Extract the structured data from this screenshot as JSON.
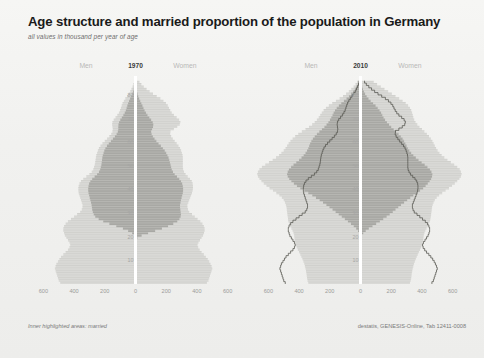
{
  "header": {
    "title": "Age structure and married proportion of the population in Germany",
    "subtitle": "all values in thousand per year of age"
  },
  "footer": {
    "note": "Inner highlighted areas: married",
    "source": "destatis, GENESIS-Online, Tab 12411-0008"
  },
  "colors": {
    "background": "#f2f2f0",
    "total_fill": "#d9d9d6",
    "married_fill": "#a8a8a4",
    "stripe": "#c6c6c2",
    "outline": "#55554f",
    "axis_text": "#9c9c9a",
    "title_text": "#1a1a1a"
  },
  "panels": [
    {
      "id": "1970",
      "year": "1970",
      "men_label": "Men",
      "women_label": "Women",
      "has_reference_outline": false
    },
    {
      "id": "2010",
      "year": "2010",
      "men_label": "Men",
      "women_label": "Women",
      "has_reference_outline": true
    }
  ],
  "chart_data": {
    "type": "bar",
    "title": "Age structure and married proportion of the population in Germany",
    "subtitle": "all values in thousand per year of age",
    "xlabel": "",
    "ylabel": "Age",
    "xlim": [
      -700,
      700
    ],
    "ylim": [
      0,
      88
    ],
    "xticks": [
      600,
      400,
      200,
      0,
      200,
      400,
      600
    ],
    "xtick_labels": [
      "600",
      "400",
      "200",
      "0",
      "200",
      "400",
      "600"
    ],
    "yticks": [
      10,
      20,
      30,
      40,
      50,
      60,
      70,
      80
    ],
    "ytick_labels": [
      "10",
      "20",
      "30",
      "40",
      "50",
      "60",
      "70",
      "80"
    ],
    "grid": false,
    "legend": "Inner highlighted areas: married",
    "source": "destatis, GENESIS-Online, Tab 12411-0008",
    "ages": [
      0,
      1,
      2,
      3,
      4,
      5,
      6,
      7,
      8,
      9,
      10,
      11,
      12,
      13,
      14,
      15,
      16,
      17,
      18,
      19,
      20,
      21,
      22,
      23,
      24,
      25,
      26,
      27,
      28,
      29,
      30,
      31,
      32,
      33,
      34,
      35,
      36,
      37,
      38,
      39,
      40,
      41,
      42,
      43,
      44,
      45,
      46,
      47,
      48,
      49,
      50,
      51,
      52,
      53,
      54,
      55,
      56,
      57,
      58,
      59,
      60,
      61,
      62,
      63,
      64,
      65,
      66,
      67,
      68,
      69,
      70,
      71,
      72,
      73,
      74,
      75,
      76,
      77,
      78,
      79,
      80,
      81,
      82,
      83,
      84,
      85
    ],
    "series": [
      {
        "name": "1970 Men total",
        "panel": "1970",
        "side": "men",
        "kind": "total",
        "values": [
          490,
          500,
          505,
          510,
          515,
          520,
          525,
          520,
          515,
          505,
          495,
          485,
          470,
          455,
          440,
          430,
          425,
          430,
          440,
          450,
          460,
          465,
          470,
          470,
          465,
          455,
          440,
          420,
          400,
          380,
          360,
          350,
          345,
          345,
          350,
          355,
          360,
          365,
          370,
          372,
          372,
          370,
          365,
          355,
          340,
          320,
          300,
          285,
          275,
          270,
          265,
          262,
          260,
          258,
          255,
          250,
          245,
          238,
          228,
          215,
          200,
          185,
          170,
          158,
          150,
          148,
          150,
          152,
          150,
          142,
          130,
          118,
          108,
          100,
          95,
          90,
          84,
          76,
          66,
          55,
          44,
          34,
          26,
          19,
          13,
          9
        ]
      },
      {
        "name": "1970 Men married",
        "panel": "1970",
        "side": "men",
        "kind": "married",
        "values": [
          0,
          0,
          0,
          0,
          0,
          0,
          0,
          0,
          0,
          0,
          0,
          0,
          0,
          0,
          0,
          0,
          0,
          0,
          0,
          2,
          8,
          22,
          48,
          82,
          125,
          170,
          210,
          240,
          262,
          272,
          278,
          282,
          284,
          286,
          290,
          294,
          298,
          302,
          306,
          308,
          308,
          306,
          302,
          294,
          282,
          266,
          250,
          238,
          230,
          226,
          222,
          220,
          218,
          216,
          213,
          208,
          203,
          196,
          186,
          174,
          160,
          147,
          134,
          123,
          115,
          112,
          112,
          111,
          107,
          99,
          89,
          79,
          70,
          63,
          58,
          53,
          48,
          42,
          35,
          28,
          21,
          15,
          11,
          7,
          5,
          3
        ]
      },
      {
        "name": "1970 Women total",
        "panel": "1970",
        "side": "women",
        "kind": "total",
        "values": [
          465,
          475,
          480,
          485,
          490,
          495,
          500,
          495,
          488,
          480,
          470,
          458,
          445,
          430,
          418,
          408,
          404,
          410,
          420,
          430,
          440,
          446,
          450,
          450,
          445,
          436,
          422,
          404,
          386,
          368,
          350,
          342,
          338,
          338,
          344,
          350,
          356,
          362,
          368,
          372,
          374,
          374,
          372,
          366,
          355,
          340,
          326,
          316,
          310,
          308,
          308,
          308,
          308,
          308,
          306,
          302,
          297,
          290,
          280,
          268,
          255,
          243,
          232,
          226,
          228,
          250,
          272,
          288,
          292,
          284,
          268,
          250,
          236,
          226,
          218,
          210,
          198,
          182,
          162,
          138,
          114,
          92,
          72,
          54,
          38,
          26
        ]
      },
      {
        "name": "1970 Women married",
        "panel": "1970",
        "side": "women",
        "kind": "married",
        "values": [
          0,
          0,
          0,
          0,
          0,
          0,
          0,
          0,
          0,
          0,
          0,
          0,
          0,
          0,
          0,
          0,
          0,
          0,
          2,
          12,
          40,
          82,
          128,
          172,
          212,
          246,
          272,
          286,
          294,
          296,
          294,
          292,
          290,
          290,
          293,
          296,
          300,
          304,
          308,
          310,
          310,
          308,
          304,
          296,
          285,
          270,
          255,
          244,
          236,
          232,
          228,
          224,
          220,
          215,
          208,
          200,
          190,
          178,
          165,
          150,
          136,
          124,
          113,
          105,
          102,
          108,
          114,
          116,
          112,
          102,
          90,
          78,
          68,
          59,
          52,
          45,
          38,
          31,
          24,
          18,
          13,
          9,
          6,
          4,
          2,
          1
        ]
      },
      {
        "name": "2010 Men total",
        "panel": "2010",
        "side": "men",
        "kind": "total",
        "values": [
          340,
          345,
          348,
          350,
          352,
          355,
          358,
          362,
          366,
          372,
          378,
          385,
          392,
          400,
          408,
          415,
          420,
          425,
          428,
          430,
          432,
          436,
          442,
          450,
          458,
          465,
          470,
          472,
          474,
          476,
          478,
          480,
          482,
          486,
          492,
          500,
          512,
          528,
          548,
          570,
          592,
          612,
          630,
          645,
          658,
          668,
          672,
          668,
          658,
          642,
          620,
          596,
          572,
          550,
          530,
          515,
          500,
          488,
          478,
          468,
          456,
          442,
          425,
          405,
          382,
          358,
          335,
          315,
          298,
          284,
          272,
          262,
          252,
          240,
          225,
          206,
          184,
          160,
          136,
          114,
          94,
          76,
          60,
          45,
          32,
          22
        ]
      },
      {
        "name": "2010 Men married",
        "panel": "2010",
        "side": "men",
        "kind": "married",
        "values": [
          0,
          0,
          0,
          0,
          0,
          0,
          0,
          0,
          0,
          0,
          0,
          0,
          0,
          0,
          0,
          0,
          0,
          0,
          0,
          1,
          3,
          8,
          16,
          28,
          44,
          62,
          82,
          102,
          122,
          142,
          162,
          182,
          202,
          222,
          244,
          266,
          290,
          314,
          340,
          366,
          392,
          414,
          434,
          450,
          464,
          474,
          478,
          474,
          466,
          452,
          436,
          418,
          400,
          384,
          370,
          358,
          348,
          340,
          334,
          328,
          320,
          310,
          298,
          284,
          268,
          251,
          235,
          221,
          209,
          199,
          190,
          182,
          175,
          166,
          155,
          141,
          125,
          108,
          91,
          75,
          61,
          48,
          37,
          27,
          18,
          12
        ]
      },
      {
        "name": "2010 Women total",
        "panel": "2010",
        "side": "women",
        "kind": "total",
        "values": [
          322,
          327,
          330,
          332,
          334,
          337,
          340,
          344,
          348,
          354,
          360,
          366,
          373,
          380,
          388,
          395,
          400,
          404,
          408,
          410,
          412,
          416,
          422,
          430,
          438,
          446,
          452,
          455,
          458,
          460,
          462,
          464,
          466,
          470,
          476,
          484,
          496,
          512,
          532,
          554,
          576,
          596,
          614,
          630,
          644,
          654,
          658,
          654,
          646,
          630,
          610,
          588,
          566,
          546,
          528,
          514,
          502,
          492,
          484,
          476,
          468,
          458,
          446,
          432,
          416,
          400,
          384,
          370,
          358,
          350,
          344,
          340,
          336,
          330,
          322,
          310,
          294,
          274,
          252,
          228,
          204,
          180,
          156,
          132,
          108,
          86
        ]
      },
      {
        "name": "2010 Women married",
        "panel": "2010",
        "side": "women",
        "kind": "married",
        "values": [
          0,
          0,
          0,
          0,
          0,
          0,
          0,
          0,
          0,
          0,
          0,
          0,
          0,
          0,
          0,
          0,
          0,
          0,
          1,
          3,
          8,
          18,
          34,
          54,
          78,
          102,
          126,
          148,
          170,
          190,
          210,
          228,
          246,
          264,
          284,
          304,
          324,
          344,
          366,
          388,
          408,
          424,
          438,
          450,
          460,
          466,
          468,
          462,
          452,
          436,
          418,
          398,
          378,
          360,
          344,
          330,
          318,
          308,
          300,
          292,
          284,
          274,
          262,
          248,
          232,
          216,
          200,
          186,
          172,
          160,
          150,
          142,
          134,
          124,
          112,
          98,
          82,
          66,
          52,
          40,
          30,
          22,
          16,
          11,
          7,
          5
        ]
      }
    ],
    "reference_outline": {
      "description": "1970 total population profile overlaid as a line on the 2010 panel",
      "men_series": "1970 Men total",
      "women_series": "1970 Women total"
    }
  }
}
